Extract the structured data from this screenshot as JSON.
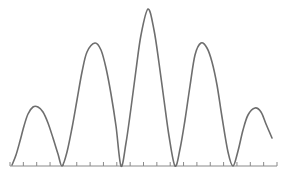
{
  "chart_data": {
    "type": "line",
    "title": "",
    "subtitle": "",
    "xlabel": "",
    "ylabel": "",
    "legend": [],
    "annotations": [],
    "grid": false,
    "legend_position": "none",
    "xlim": [
      0,
      20
    ],
    "ylim": [
      0,
      1
    ],
    "x_axis": {
      "visible": true,
      "axis_color": "#8a8a8a",
      "tick_count": 20,
      "tick_labels": [],
      "tick_direction": "up",
      "tick_length_px": 4,
      "baseline_y_px": 166,
      "start_x_px": 10,
      "end_x_px": 277
    },
    "y_axis": {
      "visible": false,
      "tick_labels": []
    },
    "series": [
      {
        "name": "interference-envelope",
        "color": "#6e6e6e",
        "line_width_px": 1.6,
        "markers": false,
        "peaks": [
          {
            "index": 1,
            "x_px": 33,
            "y_px": 107,
            "value": 0.39
          },
          {
            "index": 2,
            "x_px": 95,
            "y_px": 43,
            "value": 0.8
          },
          {
            "index": 3,
            "x_px": 148,
            "y_px": 9,
            "value": 1.0
          },
          {
            "index": 4,
            "x_px": 201,
            "y_px": 43,
            "value": 0.8
          },
          {
            "index": 5,
            "x_px": 255,
            "y_px": 108,
            "value": 0.38
          }
        ],
        "zeros": [
          {
            "index": 1,
            "x_px": 62,
            "value": 0.0
          },
          {
            "index": 2,
            "x_px": 121,
            "value": 0.0
          },
          {
            "index": 3,
            "x_px": 175,
            "value": 0.0
          },
          {
            "index": 4,
            "x_px": 233,
            "value": 0.0
          }
        ],
        "endpoints": {
          "left": {
            "x_px": 12,
            "y_px": 165,
            "value": 0.0
          },
          "right": {
            "x_px": 272,
            "y_px": 138,
            "value": 0.17
          }
        },
        "x": [
          12,
          16,
          20,
          24,
          28,
          33,
          38,
          43,
          48,
          53,
          58,
          62,
          67,
          72,
          77,
          82,
          87,
          95,
          101,
          106,
          111,
          116,
          121,
          126,
          131,
          136,
          141,
          148,
          154,
          159,
          164,
          169,
          175,
          180,
          185,
          190,
          195,
          201,
          207,
          212,
          217,
          222,
          228,
          233,
          238,
          243,
          248,
          255,
          261,
          266,
          272
        ],
        "y": [
          165,
          155,
          141,
          126,
          114,
          107,
          107,
          112,
          123,
          138,
          154,
          166,
          152,
          128,
          100,
          72,
          52,
          43,
          50,
          68,
          94,
          126,
          166,
          143,
          108,
          70,
          35,
          9,
          30,
          63,
          100,
          136,
          166,
          149,
          120,
          86,
          55,
          43,
          48,
          62,
          85,
          117,
          152,
          166,
          151,
          130,
          115,
          108,
          112,
          124,
          138
        ]
      }
    ]
  },
  "figure": {
    "background_color": "#ffffff",
    "width_px": 285,
    "height_px": 176
  }
}
